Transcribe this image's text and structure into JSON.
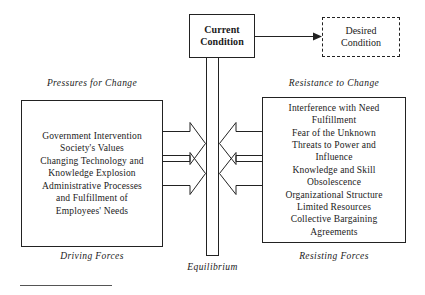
{
  "diagram": {
    "colors": {
      "stroke": "#222222",
      "text": "#1a1a1a",
      "background": "#ffffff",
      "rule": "#555555"
    },
    "current_condition": {
      "label": "Current\nCondition",
      "line1": "Current",
      "line2": "Condition",
      "style": "solid"
    },
    "desired_condition": {
      "label": "Desired\nCondition",
      "line1": "Desired",
      "line2": "Condition",
      "style": "dashed"
    },
    "left_side": {
      "heading": "Pressures for Change",
      "footer": "Driving Forces",
      "items": [
        "Government Intervention",
        "Society's Values",
        "Changing Technology and\n   Knowledge Explosion",
        "Administrative Processes\n   and Fulfillment of\n   Employees' Needs"
      ]
    },
    "right_side": {
      "heading": "Resistance to Change",
      "footer": "Resisting Forces",
      "items": [
        "Interference with Need\n   Fulfillment",
        "Fear of the Unknown",
        "Threats to Power and\n   Influence",
        "Knowledge and Skill\n   Obsolescence",
        "Organizational Structure",
        "Limited Resources",
        "Collective Bargaining\n   Agreements"
      ]
    },
    "center": {
      "equilibrium_label": "Equilibrium"
    }
  }
}
